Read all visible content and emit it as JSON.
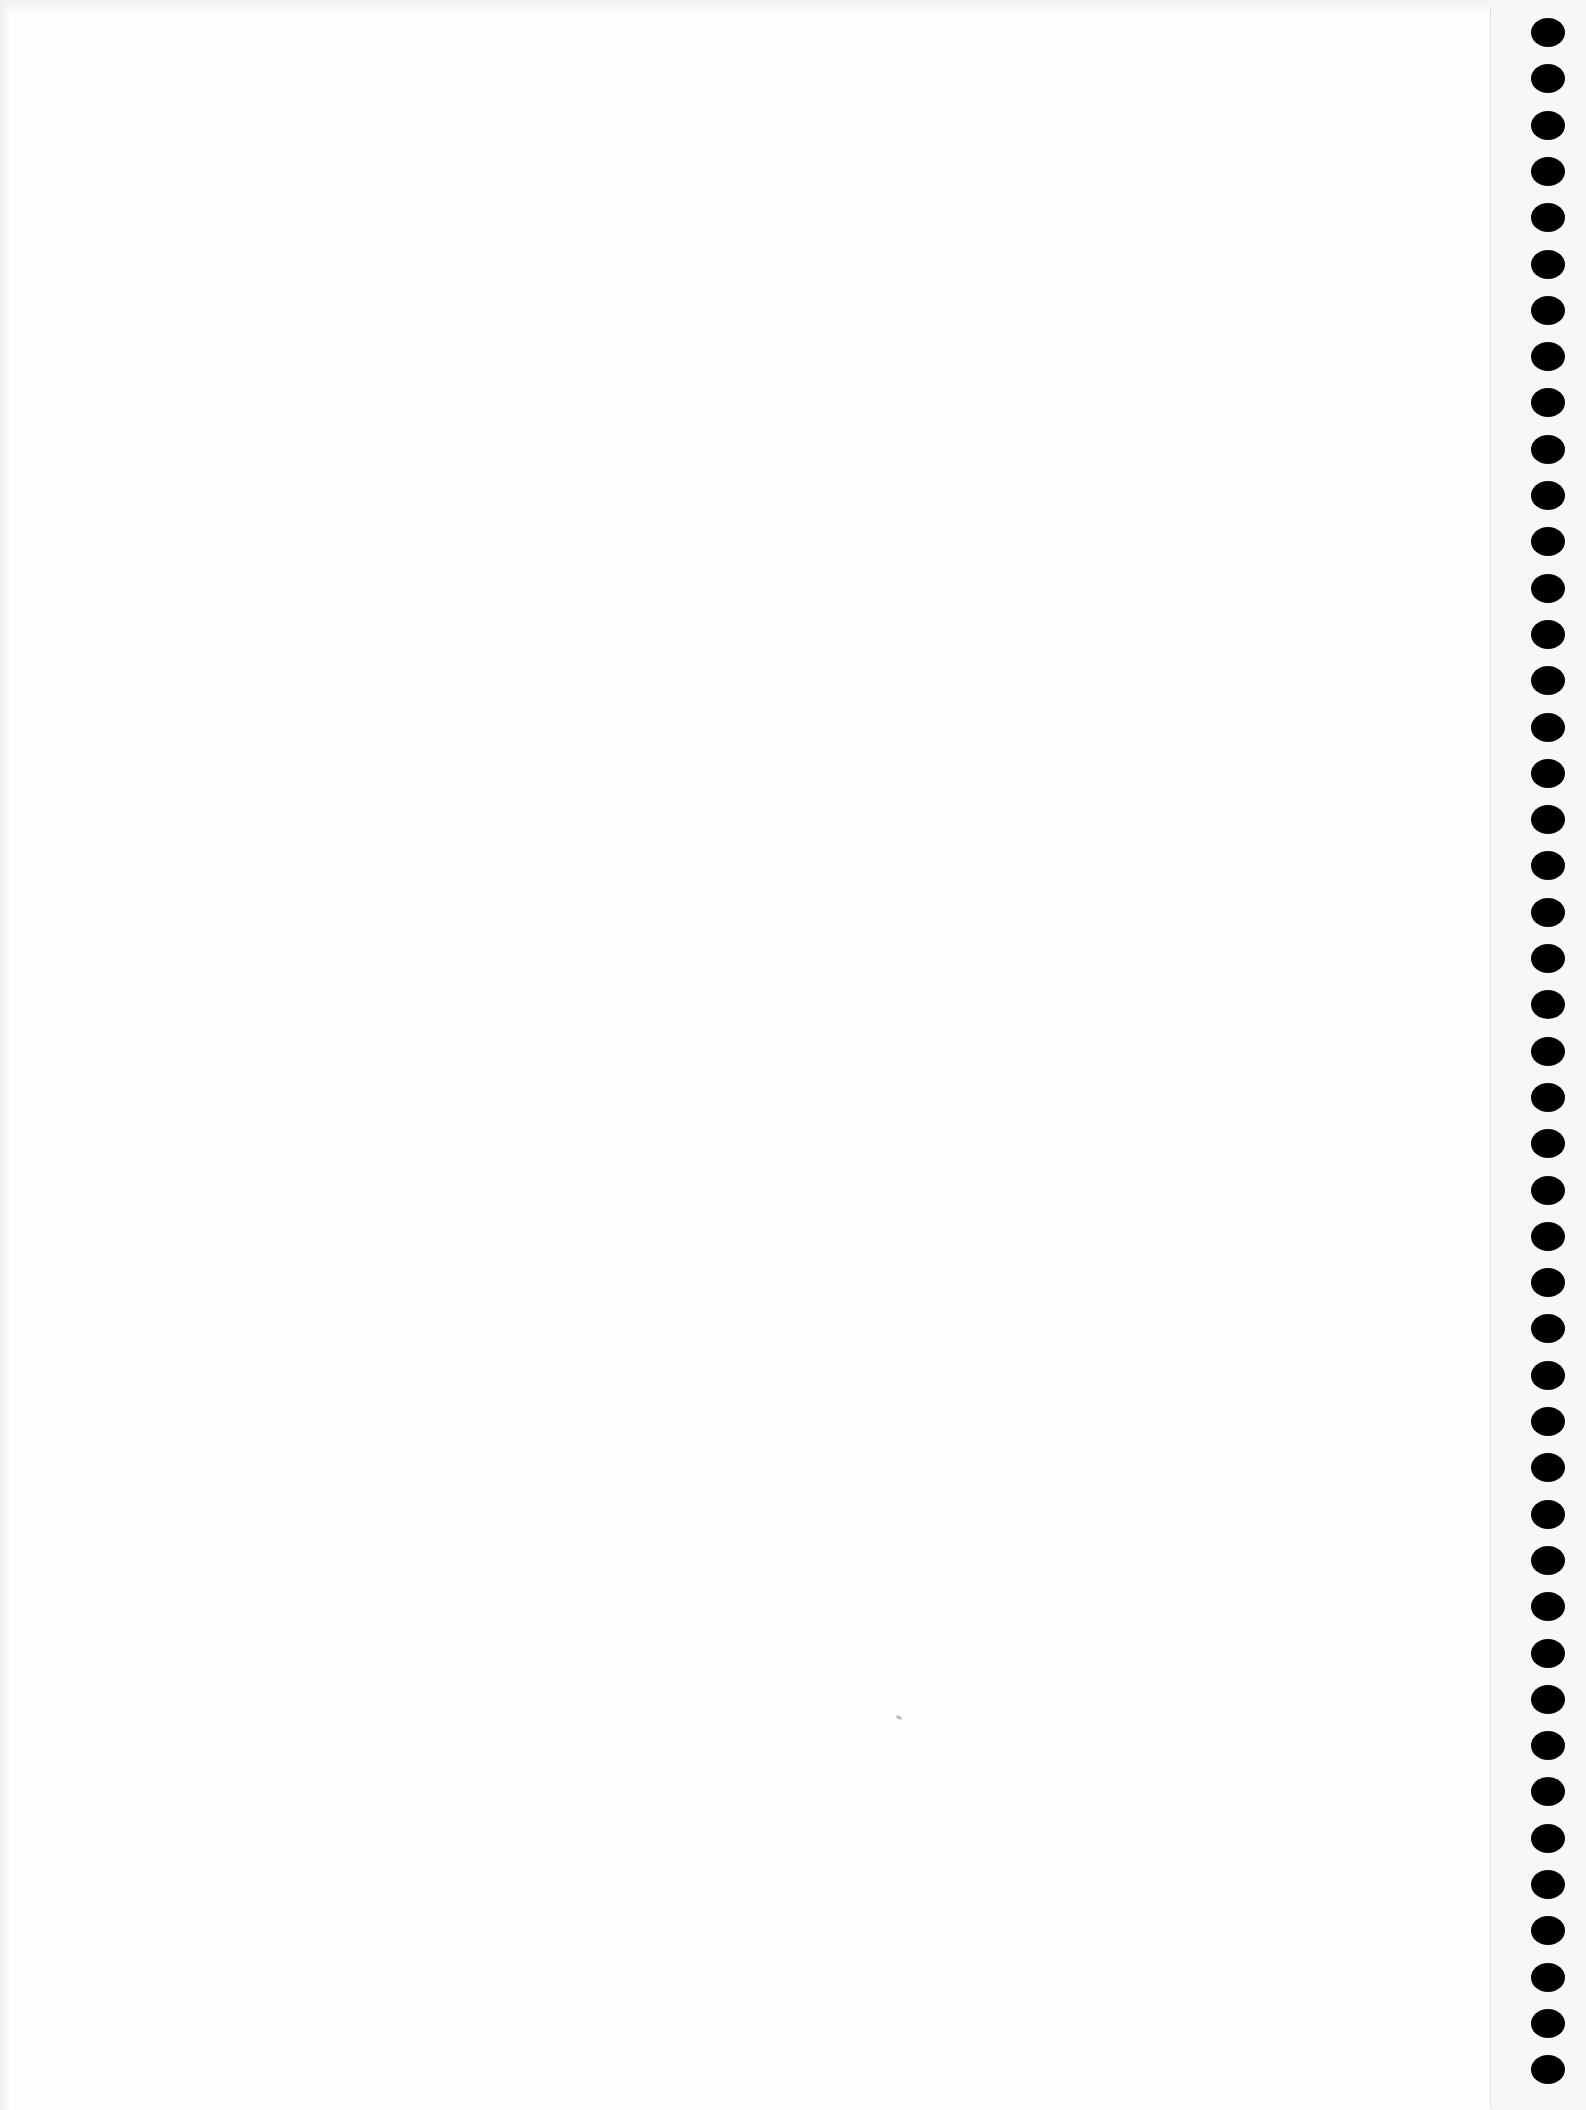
{
  "document": {
    "type": "blank scanned sheet",
    "text_content": "",
    "background_color": "#fefefe"
  },
  "binding": {
    "style": "punched binding holes",
    "side": "right",
    "hole_count": 45,
    "hole_color": "#000000",
    "first_hole_top": 18,
    "hole_spacing": 46.3,
    "perforation_line_x": 1490
  }
}
